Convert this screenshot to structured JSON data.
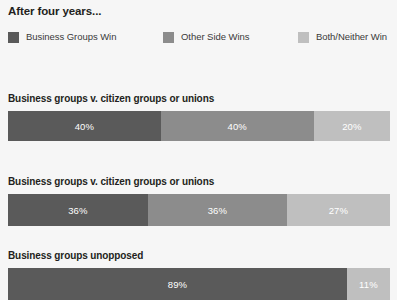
{
  "title": "After four years...",
  "colors": {
    "background": "#f6f6f6",
    "series_business": "#5a5a5a",
    "series_other": "#8c8c8c",
    "series_both": "#bfbfbf",
    "text": "#231f20",
    "value_text": "#ffffff"
  },
  "legend": {
    "items": [
      {
        "label": "Business Groups Win",
        "color": "#5a5a5a",
        "swatch_name": "legend-swatch-business-groups-win"
      },
      {
        "label": "Other Side Wins",
        "color": "#8c8c8c",
        "swatch_name": "legend-swatch-other-side-wins"
      },
      {
        "label": "Both/Neither Win",
        "color": "#bfbfbf",
        "swatch_name": "legend-swatch-both-neither-win"
      }
    ]
  },
  "chart_data": {
    "type": "bar",
    "orientation": "horizontal",
    "stacked": true,
    "title": "After four years...",
    "xlabel": "",
    "ylabel": "",
    "xlim": [
      0,
      100
    ],
    "grid": false,
    "legend_position": "top",
    "categories": [
      "Business groups v. citizen groups or unions",
      "Business groups v. citizen groups or unions",
      "Business groups unopposed"
    ],
    "series": [
      {
        "name": "Business Groups Win",
        "color": "#5a5a5a",
        "values": [
          40,
          36,
          89
        ]
      },
      {
        "name": "Other Side Wins",
        "color": "#8c8c8c",
        "values": [
          40,
          36,
          null
        ]
      },
      {
        "name": "Both/Neither Win",
        "color": "#bfbfbf",
        "values": [
          20,
          27,
          11
        ]
      }
    ],
    "value_labels": [
      [
        "40%",
        "40%",
        "20%"
      ],
      [
        "36%",
        "36%",
        "27%"
      ],
      [
        "89%",
        "11%"
      ]
    ]
  },
  "bars": [
    {
      "label": "Business groups v. citizen groups or unions",
      "segments": [
        {
          "value": "40%",
          "pct": 40.0,
          "color": "#5a5a5a",
          "name": "bar-segment-business-groups-win"
        },
        {
          "value": "40%",
          "pct": 40.0,
          "color": "#8c8c8c",
          "name": "bar-segment-other-side-wins"
        },
        {
          "value": "20%",
          "pct": 20.0,
          "color": "#bfbfbf",
          "name": "bar-segment-both-neither-win"
        }
      ]
    },
    {
      "label": "Business groups v. citizen groups or unions",
      "segments": [
        {
          "value": "36%",
          "pct": 36.6,
          "color": "#5a5a5a",
          "name": "bar-segment-business-groups-win"
        },
        {
          "value": "36%",
          "pct": 36.4,
          "color": "#8c8c8c",
          "name": "bar-segment-other-side-wins"
        },
        {
          "value": "27%",
          "pct": 27.0,
          "color": "#bfbfbf",
          "name": "bar-segment-both-neither-win"
        }
      ]
    },
    {
      "label": "Business groups unopposed",
      "segments": [
        {
          "value": "89%",
          "pct": 88.7,
          "color": "#5a5a5a",
          "name": "bar-segment-business-groups-win"
        },
        {
          "value": "11%",
          "pct": 11.3,
          "color": "#bfbfbf",
          "name": "bar-segment-both-neither-win"
        }
      ]
    }
  ]
}
